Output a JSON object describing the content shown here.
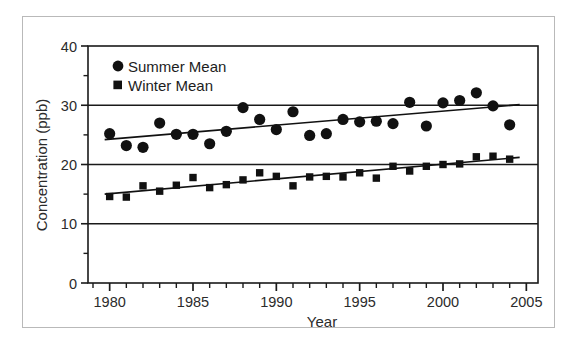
{
  "chart_data": {
    "type": "scatter",
    "title": "",
    "xlabel": "Year",
    "ylabel": "Concentration (ppb)",
    "xlim": [
      1978.7,
      2005.7
    ],
    "ylim": [
      0,
      40
    ],
    "x_major_ticks": [
      1980,
      1985,
      1990,
      1995,
      2000,
      2005
    ],
    "x_tick_labels": [
      "1980",
      "1985",
      "1990",
      "1995",
      "2000",
      "2005"
    ],
    "x_minor_tick_step": 1,
    "y_major_ticks": [
      0,
      10,
      20,
      30,
      40
    ],
    "y_tick_labels": [
      "0",
      "10",
      "20",
      "30",
      "40"
    ],
    "y_minor_ticks": [
      5,
      15,
      25,
      35
    ],
    "grid": "horizontal-major-only",
    "legend_position": "top-left-inside",
    "marker_color": "#111111",
    "line_color": "#111111",
    "axis_color": "#1a1a1a",
    "series": [
      {
        "name": "Summer Mean",
        "marker": "circle",
        "x": [
          1980,
          1981,
          1982,
          1983,
          1984,
          1985,
          1986,
          1987,
          1988,
          1989,
          1990,
          1991,
          1992,
          1993,
          1994,
          1995,
          1996,
          1997,
          1998,
          1999,
          2000,
          2001,
          2002,
          2003,
          2004
        ],
        "values": [
          25.2,
          23.2,
          22.9,
          27.0,
          25.1,
          25.1,
          23.5,
          25.6,
          29.6,
          27.6,
          25.9,
          28.9,
          24.9,
          25.2,
          27.6,
          27.2,
          27.3,
          26.9,
          30.5,
          26.5,
          30.4,
          30.8,
          32.1,
          29.9,
          26.7
        ],
        "trend": {
          "x0": 1979.7,
          "y0": 24.2,
          "x1": 2004.6,
          "y1": 30.1
        }
      },
      {
        "name": "Winter Mean",
        "marker": "square",
        "x": [
          1980,
          1981,
          1982,
          1983,
          1984,
          1985,
          1986,
          1987,
          1988,
          1989,
          1990,
          1991,
          1992,
          1993,
          1994,
          1995,
          1996,
          1997,
          1998,
          1999,
          2000,
          2001,
          2002,
          2003,
          2004
        ],
        "values": [
          14.6,
          14.5,
          16.4,
          15.5,
          16.5,
          17.8,
          16.1,
          16.6,
          17.4,
          18.6,
          18.0,
          16.4,
          17.9,
          18.0,
          17.9,
          18.6,
          17.7,
          19.7,
          18.9,
          19.7,
          20.0,
          20.1,
          21.3,
          21.4,
          20.9
        ],
        "trend": {
          "x0": 1979.7,
          "y0": 15.0,
          "x1": 2004.6,
          "y1": 21.2
        }
      }
    ],
    "legend": [
      {
        "label": "Summer Mean",
        "marker": "circle"
      },
      {
        "label": "Winter Mean",
        "marker": "square"
      }
    ]
  }
}
